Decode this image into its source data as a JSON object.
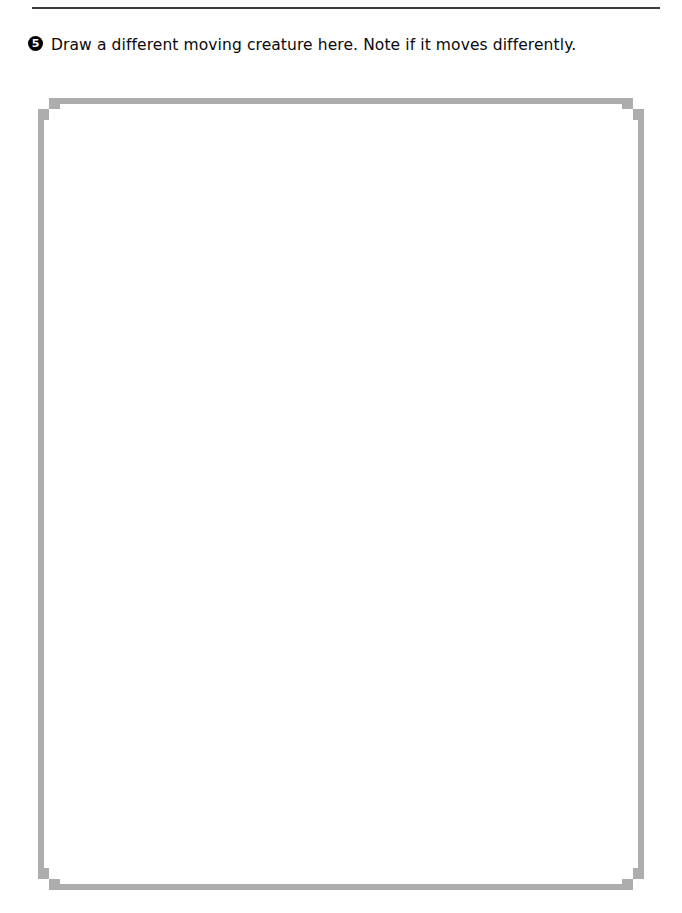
{
  "page": {
    "background_color": "#ffffff",
    "rule_color": "#3d3d3d",
    "box_border_color": "#adadad",
    "text_color": "#0a0a0a"
  },
  "divider": {
    "name": "top-horizontal-rule"
  },
  "instruction": {
    "number": "5",
    "text": "Draw a different moving creature here. Note if it moves differently."
  },
  "drawing_area": {
    "label": "blank drawing box",
    "content": ""
  }
}
